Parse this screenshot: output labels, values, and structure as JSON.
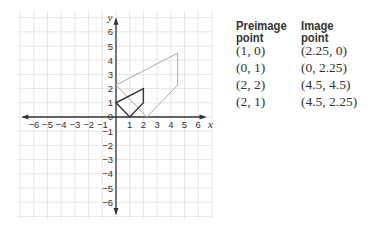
{
  "graph": {
    "x_axis_label": "x",
    "y_axis_label": "y",
    "x_range": [
      -6,
      6
    ],
    "y_range": [
      -6,
      6
    ],
    "x_ticks": [
      "-6",
      "-5",
      "-4",
      "-3",
      "-2",
      "-1",
      "1",
      "2",
      "3",
      "4",
      "5",
      "6"
    ],
    "y_ticks": [
      "6",
      "5",
      "4",
      "3",
      "2",
      "1",
      "-1",
      "-2",
      "-3",
      "-4",
      "-5",
      "-6"
    ],
    "origin_label": "0",
    "preimage_polygon": [
      [
        1,
        0
      ],
      [
        0,
        1
      ],
      [
        2,
        2
      ],
      [
        2,
        1
      ]
    ],
    "image_polygon": [
      [
        2.25,
        0
      ],
      [
        0,
        2.25
      ],
      [
        4.5,
        4.5
      ],
      [
        4.5,
        2.25
      ]
    ],
    "colors": {
      "preimage": "#333333",
      "image": "#aaaaaa",
      "axis": "#333333",
      "grid": "#e6e6e6"
    }
  },
  "table": {
    "headers": [
      {
        "line1": "Preimage",
        "line2": "point"
      },
      {
        "line1": "Image",
        "line2": "point"
      }
    ],
    "rows": [
      [
        "(1, 0)",
        "(2.25, 0)"
      ],
      [
        "(0, 1)",
        "(0, 2.25)"
      ],
      [
        "(2, 2)",
        "(4.5, 4.5)"
      ],
      [
        "(2, 1)",
        "(4.5, 2.25)"
      ]
    ]
  }
}
